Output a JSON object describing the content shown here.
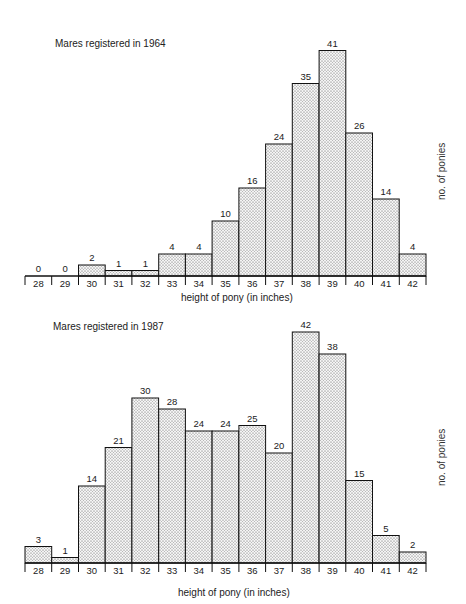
{
  "chart_data": [
    {
      "type": "bar",
      "title": "Mares registered in 1964",
      "xlabel": "height of pony (in inches)",
      "ylabel": "no. of ponies",
      "categories": [
        "28",
        "29",
        "30",
        "31",
        "32",
        "33",
        "34",
        "35",
        "36",
        "37",
        "38",
        "39",
        "40",
        "41",
        "42"
      ],
      "values": [
        0,
        0,
        2,
        1,
        1,
        4,
        4,
        10,
        16,
        24,
        35,
        41,
        26,
        14,
        4
      ],
      "ylim": [
        0,
        45
      ],
      "grid": false,
      "data_labels": true,
      "fill": "stippled"
    },
    {
      "type": "bar",
      "title": "Mares registered in 1987",
      "xlabel": "height of pony (in inches)",
      "ylabel": "no. of ponies",
      "categories": [
        "28",
        "29",
        "30",
        "31",
        "32",
        "33",
        "34",
        "35",
        "36",
        "37",
        "38",
        "39",
        "40",
        "41",
        "42"
      ],
      "values": [
        3,
        1,
        14,
        21,
        30,
        28,
        24,
        24,
        25,
        20,
        42,
        38,
        15,
        5,
        2
      ],
      "ylim": [
        0,
        45
      ],
      "grid": false,
      "data_labels": true,
      "fill": "stippled"
    }
  ]
}
